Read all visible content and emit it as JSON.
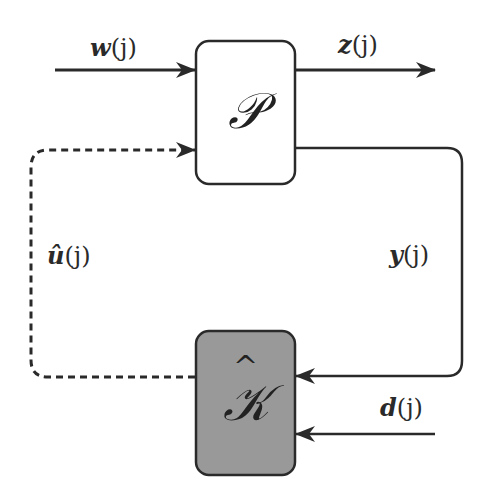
{
  "diagram": {
    "type": "block-diagram",
    "blocks": [
      {
        "id": "P",
        "label": "𝒫",
        "fill": "#ffffff",
        "stroke": "#2a2a2a"
      },
      {
        "id": "K_hat",
        "label": "𝒦",
        "hat": "^",
        "fill": "#999999",
        "stroke": "#2a2a2a"
      }
    ],
    "signals": [
      {
        "id": "w",
        "var": "w",
        "arg": "(j)",
        "from": "external",
        "to": "P",
        "style": "solid"
      },
      {
        "id": "z",
        "var": "z",
        "arg": "(j)",
        "from": "P",
        "to": "external",
        "style": "solid"
      },
      {
        "id": "y",
        "var": "y",
        "arg": "(j)",
        "from": "P",
        "to": "K_hat",
        "style": "solid"
      },
      {
        "id": "u_hat",
        "var": "û",
        "arg": "(j)",
        "from": "K_hat",
        "to": "P",
        "style": "dashed"
      },
      {
        "id": "d",
        "var": "d",
        "arg": "(j)",
        "from": "external",
        "to": "K_hat",
        "style": "solid"
      }
    ],
    "colors": {
      "line": "#2a2a2a",
      "k_fill": "#999999",
      "p_fill": "#ffffff",
      "background": "#ffffff"
    }
  }
}
